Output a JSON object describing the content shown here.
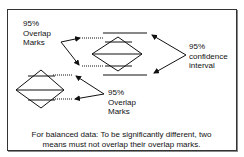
{
  "labels": {
    "top_left": [
      "95%",
      "Overlap",
      "Marks"
    ],
    "right": [
      "95%",
      "confidence",
      "interval"
    ],
    "bottom_middle": [
      "95%",
      "Overlap",
      "Marks"
    ]
  },
  "caption": {
    "line1": "For balanced data: To be significantly different, two",
    "line2": "means must not overlap their overlap marks."
  },
  "colors": {
    "stroke": "#111111",
    "background": "#ffffff",
    "frame": "#333333"
  }
}
